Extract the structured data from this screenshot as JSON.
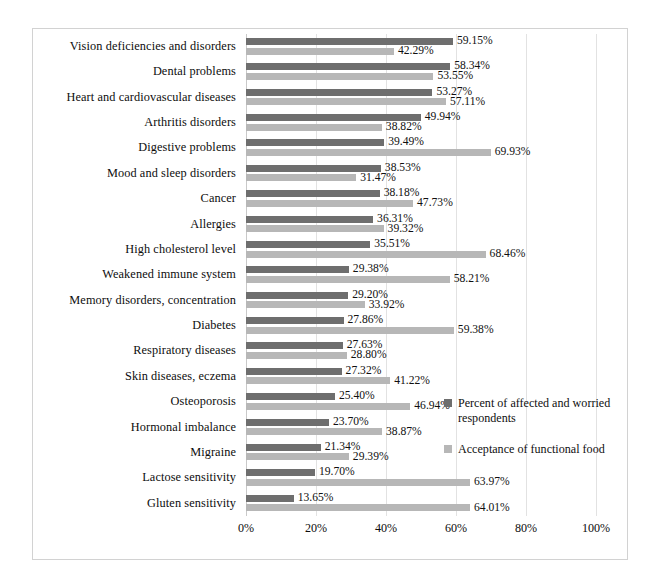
{
  "chart_data": {
    "type": "bar",
    "orientation": "horizontal",
    "title": "",
    "xlabel": "",
    "ylabel": "",
    "xlim": [
      0,
      100
    ],
    "xticks": [
      "0%",
      "20%",
      "40%",
      "60%",
      "80%",
      "100%"
    ],
    "xtick_values": [
      0,
      20,
      40,
      60,
      80,
      100
    ],
    "grid": true,
    "legend_position": "center-right",
    "value_label_suffix": "%",
    "categories": [
      "Vision deficiencies and disorders",
      "Dental problems",
      "Heart and cardiovascular diseases",
      "Arthritis disorders",
      "Digestive problems",
      "Mood and sleep disorders",
      "Cancer",
      "Allergies",
      "High cholesterol level",
      "Weakened immune system",
      "Memory disorders, concentration",
      "Diabetes",
      "Respiratory diseases",
      "Skin diseases, eczema",
      "Osteoporosis",
      "Hormonal imbalance",
      "Migraine",
      "Lactose sensitivity",
      "Gluten sensitivity"
    ],
    "series": [
      {
        "name": "Percent of affected and worried respondents",
        "color": "#6e6e6e",
        "values": [
          59.15,
          58.34,
          53.27,
          49.94,
          39.49,
          38.53,
          38.18,
          36.31,
          35.51,
          29.38,
          29.2,
          27.86,
          27.63,
          27.32,
          25.4,
          23.7,
          21.34,
          19.7,
          13.65
        ],
        "labels": [
          "59.15%",
          "58.34%",
          "53.27%",
          "49.94%",
          "39.49%",
          "38.53%",
          "38.18%",
          "36.31%",
          "35.51%",
          "29.38%",
          "29.20%",
          "27.86%",
          "27.63%",
          "27.32%",
          "25.40%",
          "23.70%",
          "21.34%",
          "19.70%",
          "13.65%"
        ]
      },
      {
        "name": "Acceptance of functional food",
        "color": "#b7b7b7",
        "values": [
          42.29,
          53.55,
          57.11,
          38.82,
          69.93,
          31.47,
          47.73,
          39.32,
          68.46,
          58.21,
          33.92,
          59.38,
          28.8,
          41.22,
          46.94,
          38.87,
          29.39,
          63.97,
          64.01
        ],
        "labels": [
          "42.29%",
          "53.55%",
          "57.11%",
          "38.82%",
          "69.93%",
          "31.47%",
          "47.73%",
          "39.32%",
          "68.46%",
          "58.21%",
          "33.92%",
          "59.38%",
          "28.80%",
          "41.22%",
          "46.94%",
          "38.87%",
          "29.39%",
          "63.97%",
          "64.01%"
        ]
      }
    ]
  },
  "legend": {
    "entries": [
      {
        "label": "Percent of affected and worried respondents",
        "color": "#6e6e6e"
      },
      {
        "label": "Acceptance of functional food",
        "color": "#b7b7b7"
      }
    ]
  }
}
